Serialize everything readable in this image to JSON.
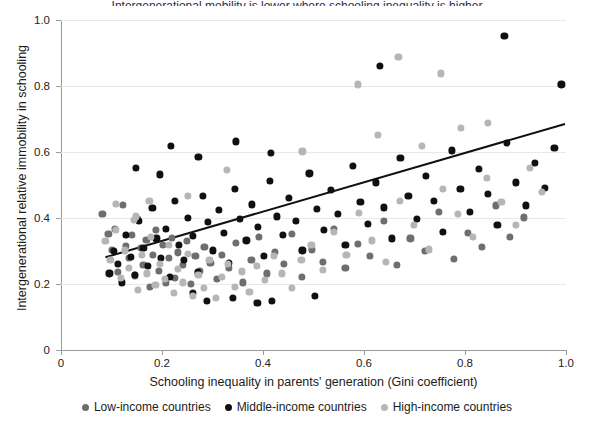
{
  "figure": {
    "width": 594,
    "height": 429,
    "background": "#ffffff",
    "cropped_title": "Intergenerational mobility is lower where schooling inequality is higher"
  },
  "axes": {
    "x_ticklabels": [
      "0",
      "0.2",
      "0.4",
      "0.6",
      "0.8",
      "1.0"
    ],
    "x_tickvalues": [
      0,
      0.2,
      0.4,
      0.6,
      0.8,
      1.0
    ],
    "y_ticklabels": [
      "0",
      "0.2",
      "0.4",
      "0.6",
      "0.8",
      "1.0"
    ],
    "y_tickvalues": [
      0,
      0.2,
      0.4,
      0.6,
      0.8,
      1.0
    ]
  },
  "legend": {
    "items": [
      {
        "label": "Low-income countries",
        "color": "#6e6e6e",
        "swatch_name": "legend-swatch-low-income"
      },
      {
        "label": "Middle-income countries",
        "color": "#101010",
        "swatch_name": "legend-swatch-middle-income"
      },
      {
        "label": "High-income countries",
        "color": "#b6b6b6",
        "swatch_name": "legend-swatch-high-income"
      }
    ]
  },
  "chart_data": {
    "type": "scatter",
    "title": "",
    "xlabel": "Schooling inequality in parents' generation (Gini coefficient)",
    "ylabel": "Intergenerational relative immobility in schooling",
    "xlim": [
      0,
      1.0
    ],
    "ylim": [
      0,
      1.0
    ],
    "grid": "horizontal",
    "legend_position": "bottom-center",
    "colors": {
      "low_income": "#6e6e6e",
      "middle_income": "#101010",
      "high_income": "#b6b6b6",
      "trendline": "#111111",
      "gridline": "#e9e9e9",
      "axis": "#9a9a9a"
    },
    "trendline": {
      "type": "linear-fit",
      "x_start": 0.088,
      "y_start": 0.281,
      "x_end": 0.998,
      "y_end": 0.685,
      "slope": 0.444,
      "intercept": 0.242,
      "color": "#111111",
      "width": 2
    },
    "marker_radius_px": 3.6,
    "series": [
      {
        "name": "Low-income countries",
        "color": "#6e6e6e",
        "points": [
          [
            0.082,
            0.413
          ],
          [
            0.094,
            0.352
          ],
          [
            0.101,
            0.303
          ],
          [
            0.107,
            0.368
          ],
          [
            0.112,
            0.236
          ],
          [
            0.122,
            0.44
          ],
          [
            0.128,
            0.316
          ],
          [
            0.134,
            0.279
          ],
          [
            0.141,
            0.349
          ],
          [
            0.147,
            0.226
          ],
          [
            0.152,
            0.398
          ],
          [
            0.158,
            0.309
          ],
          [
            0.163,
            0.257
          ],
          [
            0.169,
            0.333
          ],
          [
            0.176,
            0.192
          ],
          [
            0.182,
            0.288
          ],
          [
            0.188,
            0.365
          ],
          [
            0.194,
            0.24
          ],
          [
            0.201,
            0.318
          ],
          [
            0.207,
            0.204
          ],
          [
            0.213,
            0.278
          ],
          [
            0.219,
            0.34
          ],
          [
            0.226,
            0.218
          ],
          [
            0.232,
            0.296
          ],
          [
            0.241,
            0.258
          ],
          [
            0.249,
            0.33
          ],
          [
            0.257,
            0.201
          ],
          [
            0.266,
            0.284
          ],
          [
            0.275,
            0.24
          ],
          [
            0.284,
            0.312
          ],
          [
            0.296,
            0.265
          ],
          [
            0.308,
            0.215
          ],
          [
            0.319,
            0.288
          ],
          [
            0.333,
            0.248
          ],
          [
            0.347,
            0.325
          ],
          [
            0.361,
            0.205
          ],
          [
            0.377,
            0.272
          ],
          [
            0.392,
            0.342
          ],
          [
            0.408,
            0.232
          ],
          [
            0.423,
            0.298
          ],
          [
            0.441,
            0.262
          ],
          [
            0.458,
            0.351
          ],
          [
            0.477,
            0.222
          ],
          [
            0.497,
            0.305
          ],
          [
            0.519,
            0.268
          ],
          [
            0.541,
            0.368
          ],
          [
            0.563,
            0.248
          ],
          [
            0.588,
            0.322
          ],
          [
            0.612,
            0.285
          ],
          [
            0.639,
            0.392
          ],
          [
            0.665,
            0.258
          ],
          [
            0.692,
            0.338
          ],
          [
            0.721,
            0.301
          ],
          [
            0.749,
            0.418
          ],
          [
            0.778,
            0.275
          ],
          [
            0.806,
            0.355
          ],
          [
            0.834,
            0.312
          ],
          [
            0.861,
            0.438
          ],
          [
            0.889,
            0.342
          ],
          [
            0.916,
            0.402
          ]
        ]
      },
      {
        "name": "Middle-income countries",
        "color": "#101010",
        "points": [
          [
            0.096,
            0.232
          ],
          [
            0.104,
            0.3
          ],
          [
            0.113,
            0.262
          ],
          [
            0.121,
            0.205
          ],
          [
            0.129,
            0.348
          ],
          [
            0.138,
            0.283
          ],
          [
            0.146,
            0.228
          ],
          [
            0.155,
            0.392
          ],
          [
            0.163,
            0.31
          ],
          [
            0.172,
            0.255
          ],
          [
            0.181,
            0.431
          ],
          [
            0.189,
            0.338
          ],
          [
            0.198,
            0.279
          ],
          [
            0.207,
            0.368
          ],
          [
            0.216,
            0.222
          ],
          [
            0.225,
            0.452
          ],
          [
            0.234,
            0.318
          ],
          [
            0.243,
            0.272
          ],
          [
            0.252,
            0.401
          ],
          [
            0.261,
            0.345
          ],
          [
            0.271,
            0.235
          ],
          [
            0.281,
            0.468
          ],
          [
            0.291,
            0.388
          ],
          [
            0.301,
            0.302
          ],
          [
            0.312,
            0.424
          ],
          [
            0.322,
            0.355
          ],
          [
            0.333,
            0.265
          ],
          [
            0.344,
            0.488
          ],
          [
            0.355,
            0.398
          ],
          [
            0.367,
            0.332
          ],
          [
            0.378,
            0.441
          ],
          [
            0.39,
            0.372
          ],
          [
            0.402,
            0.285
          ],
          [
            0.414,
            0.512
          ],
          [
            0.427,
            0.405
          ],
          [
            0.439,
            0.348
          ],
          [
            0.452,
            0.462
          ],
          [
            0.465,
            0.392
          ],
          [
            0.478,
            0.302
          ],
          [
            0.492,
            0.535
          ],
          [
            0.506,
            0.428
          ],
          [
            0.52,
            0.365
          ],
          [
            0.534,
            0.485
          ],
          [
            0.548,
            0.412
          ],
          [
            0.563,
            0.318
          ],
          [
            0.578,
            0.558
          ],
          [
            0.593,
            0.448
          ],
          [
            0.608,
            0.382
          ],
          [
            0.624,
            0.508
          ],
          [
            0.64,
            0.432
          ],
          [
            0.656,
            0.338
          ],
          [
            0.672,
            0.582
          ],
          [
            0.688,
            0.468
          ],
          [
            0.705,
            0.398
          ],
          [
            0.722,
            0.528
          ],
          [
            0.739,
            0.452
          ],
          [
            0.756,
            0.358
          ],
          [
            0.774,
            0.605
          ],
          [
            0.791,
            0.488
          ],
          [
            0.809,
            0.418
          ],
          [
            0.827,
            0.548
          ],
          [
            0.846,
            0.472
          ],
          [
            0.864,
            0.378
          ],
          [
            0.883,
            0.628
          ],
          [
            0.901,
            0.508
          ],
          [
            0.92,
            0.438
          ],
          [
            0.939,
            0.568
          ],
          [
            0.958,
            0.492
          ],
          [
            0.977,
            0.612
          ],
          [
            0.991,
            0.805
          ],
          [
            0.878,
            0.952
          ],
          [
            0.632,
            0.862
          ],
          [
            0.218,
            0.618
          ],
          [
            0.272,
            0.585
          ],
          [
            0.347,
            0.632
          ],
          [
            0.416,
            0.598
          ],
          [
            0.502,
            0.165
          ],
          [
            0.341,
            0.158
          ],
          [
            0.389,
            0.142
          ],
          [
            0.418,
            0.148
          ],
          [
            0.148,
            0.552
          ],
          [
            0.196,
            0.532
          ],
          [
            0.289,
            0.148
          ],
          [
            0.262,
            0.172
          ]
        ]
      },
      {
        "name": "High-income countries",
        "color": "#b6b6b6",
        "points": [
          [
            0.088,
            0.33
          ],
          [
            0.098,
            0.272
          ],
          [
            0.108,
            0.365
          ],
          [
            0.118,
            0.218
          ],
          [
            0.126,
            0.302
          ],
          [
            0.135,
            0.248
          ],
          [
            0.144,
            0.395
          ],
          [
            0.152,
            0.182
          ],
          [
            0.161,
            0.288
          ],
          [
            0.17,
            0.232
          ],
          [
            0.178,
            0.342
          ],
          [
            0.187,
            0.198
          ],
          [
            0.196,
            0.262
          ],
          [
            0.205,
            0.215
          ],
          [
            0.214,
            0.318
          ],
          [
            0.223,
            0.172
          ],
          [
            0.232,
            0.245
          ],
          [
            0.242,
            0.205
          ],
          [
            0.252,
            0.292
          ],
          [
            0.262,
            0.165
          ],
          [
            0.272,
            0.228
          ],
          [
            0.283,
            0.188
          ],
          [
            0.294,
            0.272
          ],
          [
            0.306,
            0.158
          ],
          [
            0.318,
            0.222
          ],
          [
            0.331,
            0.262
          ],
          [
            0.344,
            0.192
          ],
          [
            0.358,
            0.238
          ],
          [
            0.373,
            0.175
          ],
          [
            0.388,
            0.255
          ],
          [
            0.404,
            0.212
          ],
          [
            0.421,
            0.285
          ],
          [
            0.438,
            0.232
          ],
          [
            0.457,
            0.188
          ],
          [
            0.476,
            0.272
          ],
          [
            0.496,
            0.318
          ],
          [
            0.518,
            0.242
          ],
          [
            0.541,
            0.358
          ],
          [
            0.565,
            0.288
          ],
          [
            0.59,
            0.415
          ],
          [
            0.616,
            0.332
          ],
          [
            0.643,
            0.268
          ],
          [
            0.671,
            0.452
          ],
          [
            0.699,
            0.378
          ],
          [
            0.728,
            0.305
          ],
          [
            0.757,
            0.488
          ],
          [
            0.786,
            0.412
          ],
          [
            0.815,
            0.342
          ],
          [
            0.844,
            0.522
          ],
          [
            0.872,
            0.448
          ],
          [
            0.9,
            0.378
          ],
          [
            0.928,
            0.552
          ],
          [
            0.952,
            0.478
          ],
          [
            0.752,
            0.838
          ],
          [
            0.588,
            0.805
          ],
          [
            0.668,
            0.888
          ],
          [
            0.175,
            0.452
          ],
          [
            0.252,
            0.468
          ],
          [
            0.328,
            0.545
          ],
          [
            0.148,
            0.405
          ],
          [
            0.108,
            0.442
          ],
          [
            0.845,
            0.688
          ],
          [
            0.792,
            0.672
          ],
          [
            0.715,
            0.618
          ],
          [
            0.628,
            0.652
          ],
          [
            0.478,
            0.602
          ]
        ]
      }
    ]
  }
}
